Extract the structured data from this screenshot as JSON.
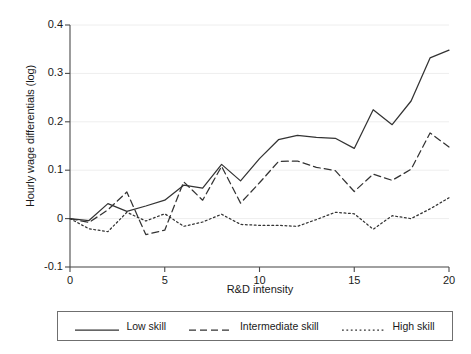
{
  "chart_data": {
    "type": "line",
    "title": "",
    "xlabel": "R&D intensity",
    "ylabel": "Hourly wage differentials (log)",
    "xlim": [
      0,
      20
    ],
    "ylim": [
      -0.1,
      0.4
    ],
    "xticks": [
      0,
      5,
      10,
      15,
      20
    ],
    "xtick_labels": [
      "0",
      "5",
      "10",
      "15",
      "20"
    ],
    "yticks": [
      -0.1,
      0,
      0.1,
      0.2,
      0.3,
      0.4
    ],
    "ytick_labels": [
      "-0.1",
      "0",
      "0.1",
      "0.2",
      "0.3",
      "0.4"
    ],
    "grid": true,
    "grid_axis": "y",
    "legend_position": "below",
    "x": [
      0,
      1,
      2,
      3,
      4,
      5,
      6,
      7,
      8,
      9,
      10,
      11,
      12,
      13,
      14,
      15,
      16,
      17,
      18,
      19,
      20
    ],
    "series": [
      {
        "name": "Low skill",
        "style": "solid",
        "color": "#333333",
        "values": [
          0.0,
          -0.004,
          0.031,
          0.015,
          0.026,
          0.038,
          0.069,
          0.063,
          0.112,
          0.078,
          0.124,
          0.163,
          0.172,
          0.168,
          0.166,
          0.145,
          0.225,
          0.194,
          0.243,
          0.332,
          0.348
        ]
      },
      {
        "name": "Intermediate skill",
        "style": "dashed",
        "color": "#333333",
        "values": [
          0.0,
          -0.008,
          0.018,
          0.055,
          -0.033,
          -0.024,
          0.076,
          0.038,
          0.108,
          0.032,
          0.074,
          0.118,
          0.119,
          0.106,
          0.099,
          0.056,
          0.092,
          0.079,
          0.102,
          0.177,
          0.148
        ]
      },
      {
        "name": "High skill",
        "style": "dotted",
        "color": "#333333",
        "values": [
          0.0,
          -0.021,
          -0.027,
          0.013,
          -0.005,
          0.01,
          -0.016,
          -0.007,
          0.009,
          -0.012,
          -0.014,
          -0.014,
          -0.016,
          -0.002,
          0.013,
          0.01,
          -0.022,
          0.006,
          0.0,
          0.02,
          0.043
        ]
      }
    ]
  },
  "legend": {
    "items": [
      {
        "label": "Low skill",
        "style": "solid"
      },
      {
        "label": "Intermediate skill",
        "style": "dashed"
      },
      {
        "label": "High skill",
        "style": "dotted"
      }
    ]
  }
}
